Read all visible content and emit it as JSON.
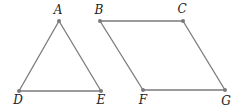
{
  "diagram": {
    "type": "geometry",
    "colors": {
      "edge": "#7a7a7a",
      "point": "#7a7a7a",
      "label": "#222222",
      "background": "#ffffff"
    },
    "points": {
      "A": {
        "label": "A",
        "x": 59,
        "y": 21,
        "lx": 58,
        "ly": 14
      },
      "B": {
        "label": "B",
        "x": 100,
        "y": 21,
        "lx": 99,
        "ly": 14
      },
      "C": {
        "label": "C",
        "x": 183,
        "y": 21,
        "lx": 182,
        "ly": 13
      },
      "D": {
        "label": "D",
        "x": 19,
        "y": 91,
        "lx": 18,
        "ly": 104
      },
      "E": {
        "label": "E",
        "x": 101,
        "y": 91,
        "lx": 101,
        "ly": 104
      },
      "F": {
        "label": "F",
        "x": 143,
        "y": 90,
        "lx": 143,
        "ly": 104
      },
      "G": {
        "label": "G",
        "x": 225,
        "y": 90,
        "lx": 226,
        "ly": 105
      }
    },
    "shapes": [
      {
        "name": "triangle-ADE",
        "kind": "triangle",
        "vertices": [
          "A",
          "D",
          "E"
        ]
      },
      {
        "name": "parallelogram-BCGF",
        "kind": "parallelogram",
        "vertices": [
          "B",
          "C",
          "G",
          "F"
        ]
      }
    ]
  }
}
